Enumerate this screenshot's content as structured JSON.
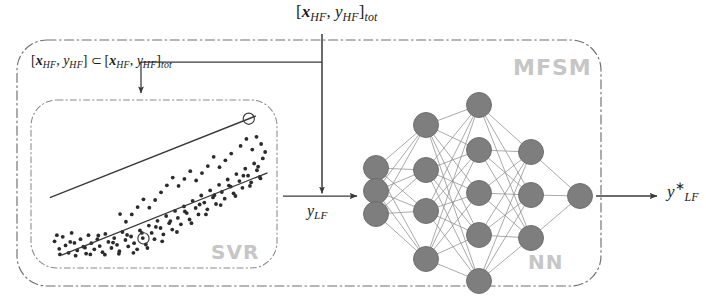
{
  "diagram": {
    "title_label": "[x_HF, y_HF]_tot",
    "outer_box_tag": "MFSM",
    "svr_box_tag": "SVR",
    "nn_box_tag": "NN"
  },
  "labels": {
    "total_dataset": {
      "bracket_open": "[",
      "var_x": "x",
      "var_x_sub": "HF",
      "comma": ", ",
      "var_y": "y",
      "var_y_sub": "HF",
      "bracket_close": "]",
      "sub_tot": "tot"
    },
    "subset": {
      "bracket_open": "[",
      "var_x": "x",
      "var_x_sub": "HF",
      "comma": ", ",
      "var_y": "y",
      "var_y_sub": "HF",
      "bracket_close": "]",
      "operator": "⊂",
      "bracket_open2": "[",
      "var_x2": "x",
      "var_x2_sub": "HF",
      "comma2": ", ",
      "var_y2": "y",
      "var_y2_sub": "HF",
      "bracket_close2": "]",
      "sub_tot": "tot"
    },
    "y_lf": {
      "var": "y",
      "sub": "LF"
    },
    "y_lf_star": {
      "var": "y",
      "sup": "∗",
      "sub": "LF"
    }
  },
  "chart_data": {
    "type": "scatter",
    "xlabel": "",
    "ylabel": "",
    "xlim": [
      0,
      1
    ],
    "ylim": [
      0,
      1
    ],
    "grid": false,
    "legend": "none",
    "annotations": [
      "SVR"
    ],
    "tube": {
      "upper_line": [
        [
          0.055,
          0.585
        ],
        [
          0.935,
          0.075
        ]
      ],
      "lower_line": [
        [
          0.105,
          0.945
        ],
        [
          0.985,
          0.43
        ]
      ],
      "support_vectors": [
        [
          0.905,
          0.092
        ],
        [
          0.455,
          0.84
        ]
      ]
    },
    "points": [
      [
        0.075,
        0.858
      ],
      [
        0.095,
        0.905
      ],
      [
        0.11,
        0.83
      ],
      [
        0.122,
        0.884
      ],
      [
        0.135,
        0.93
      ],
      [
        0.148,
        0.806
      ],
      [
        0.16,
        0.868
      ],
      [
        0.172,
        0.915
      ],
      [
        0.186,
        0.845
      ],
      [
        0.198,
        0.892
      ],
      [
        0.21,
        0.935
      ],
      [
        0.22,
        0.82
      ],
      [
        0.232,
        0.87
      ],
      [
        0.245,
        0.908
      ],
      [
        0.258,
        0.845
      ],
      [
        0.268,
        0.888
      ],
      [
        0.28,
        0.926
      ],
      [
        0.292,
        0.812
      ],
      [
        0.305,
        0.862
      ],
      [
        0.318,
        0.9
      ],
      [
        0.33,
        0.838
      ],
      [
        0.342,
        0.88
      ],
      [
        0.352,
        0.92
      ],
      [
        0.365,
        0.8
      ],
      [
        0.378,
        0.85
      ],
      [
        0.39,
        0.89
      ],
      [
        0.402,
        0.828
      ],
      [
        0.415,
        0.87
      ],
      [
        0.428,
        0.908
      ],
      [
        0.44,
        0.79
      ],
      [
        0.452,
        0.838
      ],
      [
        0.465,
        0.878
      ],
      [
        0.478,
        0.76
      ],
      [
        0.49,
        0.806
      ],
      [
        0.502,
        0.845
      ],
      [
        0.515,
        0.73
      ],
      [
        0.528,
        0.775
      ],
      [
        0.54,
        0.815
      ],
      [
        0.552,
        0.7
      ],
      [
        0.565,
        0.745
      ],
      [
        0.578,
        0.785
      ],
      [
        0.59,
        0.668
      ],
      [
        0.602,
        0.712
      ],
      [
        0.615,
        0.752
      ],
      [
        0.628,
        0.64
      ],
      [
        0.64,
        0.682
      ],
      [
        0.652,
        0.722
      ],
      [
        0.665,
        0.605
      ],
      [
        0.678,
        0.65
      ],
      [
        0.69,
        0.69
      ],
      [
        0.702,
        0.572
      ],
      [
        0.715,
        0.616
      ],
      [
        0.728,
        0.658
      ],
      [
        0.74,
        0.54
      ],
      [
        0.752,
        0.584
      ],
      [
        0.765,
        0.625
      ],
      [
        0.778,
        0.505
      ],
      [
        0.79,
        0.55
      ],
      [
        0.802,
        0.592
      ],
      [
        0.815,
        0.472
      ],
      [
        0.828,
        0.516
      ],
      [
        0.84,
        0.558
      ],
      [
        0.852,
        0.438
      ],
      [
        0.865,
        0.482
      ],
      [
        0.878,
        0.524
      ],
      [
        0.89,
        0.404
      ],
      [
        0.902,
        0.448
      ],
      [
        0.915,
        0.49
      ],
      [
        0.928,
        0.372
      ],
      [
        0.94,
        0.414
      ],
      [
        0.952,
        0.456
      ],
      [
        0.965,
        0.34
      ],
      [
        0.085,
        0.82
      ],
      [
        0.142,
        0.862
      ],
      [
        0.205,
        0.898
      ],
      [
        0.262,
        0.822
      ],
      [
        0.325,
        0.866
      ],
      [
        0.385,
        0.818
      ],
      [
        0.448,
        0.806
      ],
      [
        0.508,
        0.768
      ],
      [
        0.57,
        0.732
      ],
      [
        0.632,
        0.672
      ],
      [
        0.695,
        0.628
      ],
      [
        0.758,
        0.57
      ],
      [
        0.82,
        0.51
      ],
      [
        0.882,
        0.448
      ],
      [
        0.945,
        0.392
      ],
      [
        0.098,
        0.94
      ],
      [
        0.165,
        0.948
      ],
      [
        0.228,
        0.94
      ],
      [
        0.29,
        0.942
      ],
      [
        0.35,
        0.936
      ],
      [
        0.412,
        0.93
      ],
      [
        0.472,
        0.9
      ],
      [
        0.535,
        0.858
      ],
      [
        0.598,
        0.8
      ],
      [
        0.66,
        0.745
      ],
      [
        0.722,
        0.69
      ],
      [
        0.785,
        0.632
      ],
      [
        0.848,
        0.575
      ],
      [
        0.91,
        0.512
      ],
      [
        0.955,
        0.465
      ],
      [
        0.87,
        0.262
      ],
      [
        0.895,
        0.218
      ],
      [
        0.92,
        0.285
      ],
      [
        0.938,
        0.205
      ],
      [
        0.958,
        0.25
      ],
      [
        0.83,
        0.31
      ],
      [
        0.805,
        0.352
      ],
      [
        0.78,
        0.395
      ],
      [
        0.755,
        0.33
      ],
      [
        0.73,
        0.388
      ],
      [
        0.705,
        0.432
      ],
      [
        0.68,
        0.478
      ],
      [
        0.655,
        0.42
      ],
      [
        0.63,
        0.468
      ],
      [
        0.605,
        0.512
      ],
      [
        0.58,
        0.46
      ],
      [
        0.555,
        0.508
      ],
      [
        0.53,
        0.552
      ],
      [
        0.505,
        0.6
      ],
      [
        0.48,
        0.648
      ],
      [
        0.455,
        0.596
      ],
      [
        0.43,
        0.644
      ],
      [
        0.405,
        0.69
      ],
      [
        0.38,
        0.736
      ],
      [
        0.355,
        0.688
      ],
      [
        0.975,
        0.3
      ]
    ]
  },
  "neural_network": {
    "layer_sizes": [
      3,
      4,
      5,
      3,
      1
    ],
    "node_color": "#7e7e7e",
    "edge_color": "#8d8d8d",
    "layers": [
      {
        "name": "input-layer",
        "x": 376,
        "ys": [
          168,
          191,
          214
        ]
      },
      {
        "name": "hidden-layer-1",
        "x": 426,
        "ys": [
          125,
          170,
          211,
          259
        ]
      },
      {
        "name": "hidden-layer-2",
        "x": 479,
        "ys": [
          105,
          150,
          193,
          235,
          281
        ]
      },
      {
        "name": "hidden-layer-3",
        "x": 531,
        "ys": [
          152,
          195,
          238
        ]
      },
      {
        "name": "output-layer",
        "x": 580,
        "ys": [
          196
        ]
      }
    ],
    "node_radius": 12.5
  },
  "flow": {
    "outer_box": {
      "x": 17,
      "y": 40,
      "w": 584,
      "h": 246,
      "radius": 30
    },
    "svr_box": {
      "x": 31,
      "y": 100,
      "w": 246,
      "h": 168,
      "radius": 26
    },
    "arrow_svr_to_nn": {
      "from": [
        283,
        196
      ],
      "to": [
        361,
        196
      ]
    },
    "arrow_out": {
      "from": [
        596,
        196
      ],
      "to": [
        660,
        196
      ]
    },
    "trunk_vertical": {
      "x": 322,
      "from_y": 34,
      "to_y": 196
    },
    "branch_to_svr": {
      "x_left": 141,
      "y_top": 62,
      "y_bottom": 97
    }
  },
  "colors": {
    "ink": "#3a3a3a",
    "tag_gray": "#c6c6c6",
    "node_fill": "#7e7e7e",
    "background": "#ffffff"
  }
}
